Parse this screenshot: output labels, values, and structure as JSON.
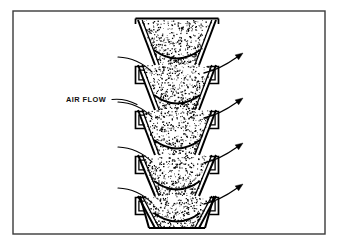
{
  "figure": {
    "name": "air-flow-through-stacked-funnel-column",
    "background_color": "#ffffff",
    "ink_color": "#000000"
  },
  "frame": {
    "name": "figure-border",
    "x": 13,
    "y": 11,
    "width": 312,
    "height": 223,
    "stroke": "#3a3a3a",
    "stroke_width": 1.4,
    "fill": "#ffffff"
  },
  "annotation": {
    "label": "AIR FLOW",
    "text_x": 66,
    "text_y": 102,
    "leader": {
      "name": "air-flow-leader-line",
      "from_x": 112,
      "from_y": 99.5,
      "to_x": 137,
      "to_y": 104.5
    }
  },
  "column": {
    "name": "hopper-column",
    "center_x": 177,
    "top_y": 20,
    "bottom_y": 228,
    "outer_half_width": 39,
    "throat_half_width": 22,
    "stage_height": 45,
    "stage_count": 5,
    "fill": "#ffffff",
    "stipple": {
      "name": "granular-media-stipple",
      "dot_color": "#000000",
      "dot_min_size": 0.55,
      "dot_max_size": 1.5,
      "density_per_stage": 430,
      "seed": 20240607
    }
  },
  "stages": [
    {
      "index": 0,
      "top_y": 20,
      "bottom_y": 65,
      "has_top_lip": true,
      "has_bottom_arc": true
    },
    {
      "index": 1,
      "top_y": 65,
      "bottom_y": 110,
      "has_top_lip": false,
      "has_bottom_arc": true
    },
    {
      "index": 2,
      "top_y": 110,
      "bottom_y": 155,
      "has_top_lip": false,
      "has_bottom_arc": true
    },
    {
      "index": 3,
      "top_y": 155,
      "bottom_y": 196,
      "has_top_lip": false,
      "has_bottom_arc": true
    },
    {
      "index": 4,
      "top_y": 196,
      "bottom_y": 228,
      "has_top_lip": false,
      "has_bottom_arc": true
    }
  ],
  "inlet_streamlines": [
    {
      "name": "inlet-streamline-1",
      "start_x": 118,
      "start_y": 57,
      "end_x": 152,
      "end_y": 72,
      "ctrl_x": 138,
      "ctrl_y": 58
    },
    {
      "name": "inlet-streamline-2",
      "start_x": 118,
      "start_y": 102,
      "end_x": 152,
      "end_y": 117,
      "ctrl_x": 138,
      "ctrl_y": 103
    },
    {
      "name": "inlet-streamline-3",
      "start_x": 118,
      "start_y": 147,
      "end_x": 152,
      "end_y": 162,
      "ctrl_x": 138,
      "ctrl_y": 148
    },
    {
      "name": "inlet-streamline-4",
      "start_x": 118,
      "start_y": 188,
      "end_x": 152,
      "end_y": 203,
      "ctrl_x": 138,
      "ctrl_y": 189
    }
  ],
  "outlet_arrows": [
    {
      "name": "outlet-arrow-1",
      "start_x": 204,
      "start_y": 73,
      "end_x": 243,
      "end_y": 53,
      "ctrl_x": 219,
      "ctrl_y": 70
    },
    {
      "name": "outlet-arrow-2",
      "start_x": 204,
      "start_y": 118,
      "end_x": 243,
      "end_y": 98,
      "ctrl_x": 219,
      "ctrl_y": 115
    },
    {
      "name": "outlet-arrow-3",
      "start_x": 204,
      "start_y": 163,
      "end_x": 243,
      "end_y": 143,
      "ctrl_x": 219,
      "ctrl_y": 160
    },
    {
      "name": "outlet-arrow-4",
      "start_x": 204,
      "start_y": 204,
      "end_x": 243,
      "end_y": 184,
      "ctrl_x": 219,
      "ctrl_y": 201
    }
  ],
  "arrowhead": {
    "name": "solid-triangle-arrowhead",
    "length": 7.5,
    "half_width": 3.0,
    "fill": "#000000"
  }
}
